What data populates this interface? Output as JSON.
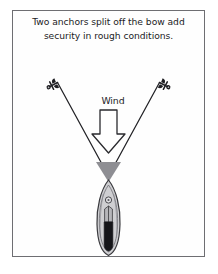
{
  "card": {
    "name": "anchoring-illustration",
    "background_color": "#ffffff",
    "border_color": "#6e6e72"
  },
  "caption": {
    "line1": "Two anchors split off the bow add",
    "line2": "security in rough conditions."
  },
  "diagram": {
    "wind_label": "Wind",
    "line_color": "#222226",
    "hull_outline_color": "#3a3a3e",
    "hull_fill_color": "#cfcfd2",
    "bow_wedge_color": "#8e8e93",
    "cockpit_color": "#16161a",
    "anchor_color": "#1e1e22",
    "arrow_outline_color": "#2a2a2e",
    "arrow_fill_color": "#ffffff",
    "elements": [
      {
        "name": "left-anchor",
        "label": "anchor"
      },
      {
        "name": "right-anchor",
        "label": "anchor"
      },
      {
        "name": "left-rode-line",
        "label": "anchor rode"
      },
      {
        "name": "right-rode-line",
        "label": "anchor rode"
      },
      {
        "name": "wind-arrow",
        "label": "Wind"
      },
      {
        "name": "sailboat-hull",
        "label": "boat"
      }
    ]
  }
}
